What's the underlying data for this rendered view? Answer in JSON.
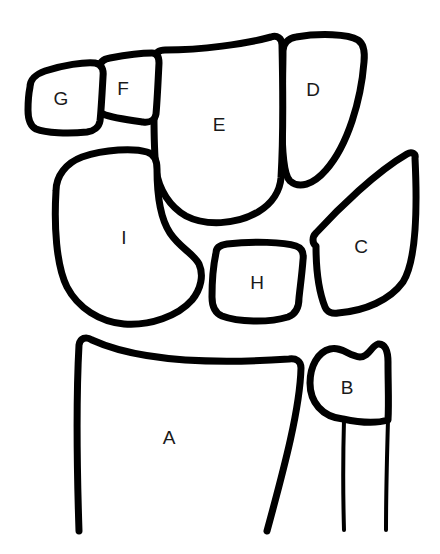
{
  "diagram": {
    "background_color": "#ffffff",
    "stroke_color": "#000000",
    "label_color": "#1a1a1a",
    "width": 440,
    "height": 554,
    "labels": [
      {
        "id": "A",
        "text": "A",
        "x": 169,
        "y": 439
      },
      {
        "id": "B",
        "text": "B",
        "x": 347,
        "y": 389
      },
      {
        "id": "C",
        "text": "C",
        "x": 361,
        "y": 248
      },
      {
        "id": "D",
        "text": "D",
        "x": 313,
        "y": 91
      },
      {
        "id": "E",
        "text": "E",
        "x": 219,
        "y": 126
      },
      {
        "id": "F",
        "text": "F",
        "x": 123,
        "y": 90
      },
      {
        "id": "G",
        "text": "G",
        "x": 61,
        "y": 100
      },
      {
        "id": "H",
        "text": "H",
        "x": 257,
        "y": 284
      },
      {
        "id": "I",
        "text": "I",
        "x": 124,
        "y": 239
      }
    ]
  }
}
